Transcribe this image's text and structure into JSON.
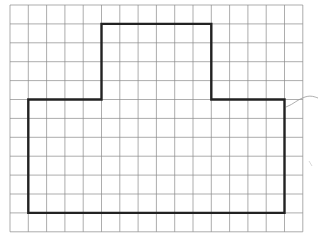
{
  "diagram": {
    "type": "grid-polygon",
    "grid": {
      "columns": 16,
      "rows": 12,
      "origin_x": 10,
      "origin_y": 5,
      "cell_width": 18.3,
      "cell_height": 18.9,
      "line_color": "#8a8a8a"
    },
    "shape": {
      "description": "T-shaped (inverted) rectilinear polygon drawn on square grid",
      "stroke_color": "#222222",
      "vertices_grid": [
        [
          5,
          1
        ],
        [
          11,
          1
        ],
        [
          11,
          5
        ],
        [
          15,
          5
        ],
        [
          15,
          11
        ],
        [
          1,
          11
        ],
        [
          1,
          5
        ],
        [
          5,
          5
        ]
      ]
    },
    "annotations": [
      {
        "type": "pen-squiggle",
        "color": "#9a9a9a"
      }
    ]
  }
}
